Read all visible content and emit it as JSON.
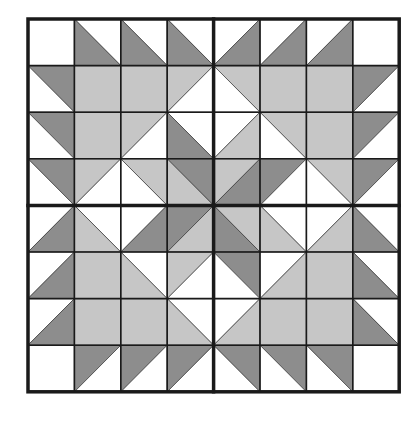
{
  "diagram": {
    "type": "quilt-block",
    "grid": {
      "rows": 8,
      "cols": 8,
      "x0": 28,
      "y0": 19,
      "cell_w": 46.4,
      "cell_h": 46.6
    },
    "colors": {
      "W": "#ffffff",
      "L": "#c6c6c6",
      "D": "#8d8d8d",
      "line": "#1a1a1a"
    },
    "cells": [
      [
        [
          "",
          "W"
        ],
        [
          "\\",
          "W",
          "D"
        ],
        [
          "\\",
          "W",
          "D"
        ],
        [
          "\\",
          "W",
          "D"
        ],
        [
          "/",
          "W",
          "D"
        ],
        [
          "/",
          "W",
          "D"
        ],
        [
          "/",
          "W",
          "D"
        ],
        [
          "",
          "W"
        ]
      ],
      [
        [
          "\\",
          "D",
          "W"
        ],
        [
          "",
          "L"
        ],
        [
          "",
          "L"
        ],
        [
          "/",
          "L",
          "W"
        ],
        [
          "\\",
          "L",
          "W"
        ],
        [
          "",
          "L"
        ],
        [
          "",
          "L"
        ],
        [
          "/",
          "D",
          "W"
        ]
      ],
      [
        [
          "\\",
          "D",
          "W"
        ],
        [
          "",
          "L"
        ],
        [
          "/",
          "L",
          "W"
        ],
        [
          "\\",
          "W",
          "D"
        ],
        [
          "/",
          "W",
          "L"
        ],
        [
          "\\",
          "L",
          "W"
        ],
        [
          "",
          "L"
        ],
        [
          "/",
          "D",
          "W"
        ]
      ],
      [
        [
          "\\",
          "D",
          "W"
        ],
        [
          "/",
          "L",
          "W"
        ],
        [
          "\\",
          "L",
          "W"
        ],
        [
          "\\",
          "D",
          "L"
        ],
        [
          "/",
          "L",
          "D"
        ],
        [
          "/",
          "D",
          "W"
        ],
        [
          "\\",
          "L",
          "W"
        ],
        [
          "/",
          "D",
          "W"
        ]
      ],
      [
        [
          "/",
          "W",
          "D"
        ],
        [
          "\\",
          "W",
          "L"
        ],
        [
          "/",
          "W",
          "D"
        ],
        [
          "/",
          "D",
          "L"
        ],
        [
          "\\",
          "L",
          "D"
        ],
        [
          "\\",
          "W",
          "L"
        ],
        [
          "/",
          "W",
          "L"
        ],
        [
          "\\",
          "W",
          "D"
        ]
      ],
      [
        [
          "/",
          "W",
          "D"
        ],
        [
          "",
          "L"
        ],
        [
          "\\",
          "W",
          "L"
        ],
        [
          "/",
          "L",
          "W"
        ],
        [
          "\\",
          "D",
          "W"
        ],
        [
          "/",
          "W",
          "L"
        ],
        [
          "",
          "L"
        ],
        [
          "\\",
          "W",
          "D"
        ]
      ],
      [
        [
          "/",
          "W",
          "D"
        ],
        [
          "",
          "L"
        ],
        [
          "",
          "L"
        ],
        [
          "\\",
          "W",
          "L"
        ],
        [
          "/",
          "W",
          "L"
        ],
        [
          "",
          "L"
        ],
        [
          "",
          "L"
        ],
        [
          "\\",
          "W",
          "D"
        ]
      ],
      [
        [
          "",
          "W"
        ],
        [
          "/",
          "D",
          "W"
        ],
        [
          "/",
          "D",
          "W"
        ],
        [
          "/",
          "D",
          "W"
        ],
        [
          "\\",
          "D",
          "W"
        ],
        [
          "\\",
          "D",
          "W"
        ],
        [
          "\\",
          "D",
          "W"
        ],
        [
          "",
          "W"
        ]
      ]
    ],
    "legend_of_cells": "each cell: [diagonal, first, second]; '\\\\' diagonal -> first=top-right triangle, second=bottom-left; '/' diagonal -> first=top-left triangle, second=bottom-right; '' -> solid fill"
  }
}
